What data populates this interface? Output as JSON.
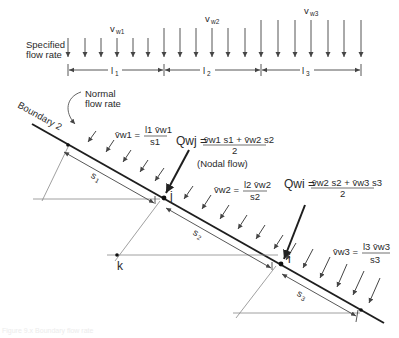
{
  "diagram": {
    "top_labels": {
      "specified_line1": "Specified",
      "specified_line2": "flow rate",
      "v_w1": "v",
      "v_w1_sub": "w1",
      "v_w2": "v",
      "v_w2_sub": "w2",
      "v_w3": "v",
      "v_w3_sub": "w3",
      "l1": "l",
      "l1_sub": "1",
      "l2": "l",
      "l2_sub": "2",
      "l3": "l",
      "l3_sub": "3"
    },
    "boundary": {
      "label": "Boundary 2",
      "normal_line1": "Normal",
      "normal_line2": "flow rate"
    },
    "equations": {
      "vbar_w1_lhs": "v̄w1 =",
      "vbar_w1_num": "l1 v̄w1",
      "vbar_w1_den": "s1",
      "vbar_w2_lhs": "v̄w2 =",
      "vbar_w2_num": "l2 v̄w2",
      "vbar_w2_den": "s2",
      "vbar_w3_lhs": "v̄w3 =",
      "vbar_w3_num": "l3 v̄w3",
      "vbar_w3_den": "s3",
      "q_wj_lhs": "Qwj =",
      "q_wj_num": "v̄w1 s1 + v̄w2 s2",
      "q_wj_den": "2",
      "q_wj_note": "(Nodal flow)",
      "q_wi_lhs": "Qwi =",
      "q_wi_num": "v̄w2 s2 + v̄w3 s3",
      "q_wi_den": "2"
    },
    "segments": {
      "s1": "s",
      "s1_sub": "1",
      "s2": "s",
      "s2_sub": "2",
      "s3": "s",
      "s3_sub": "3"
    },
    "nodes": {
      "j": "j",
      "i": "i",
      "k": "k"
    },
    "colors": {
      "ink": "#2a2a2a",
      "light_ink": "#7a7a7a",
      "background": "#ffffff"
    },
    "caption": "Figure 9.x  Boundary flow rate"
  }
}
